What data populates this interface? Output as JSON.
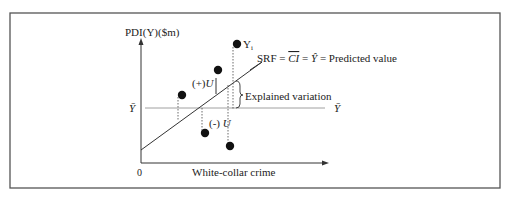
{
  "diagram": {
    "y_axis_label": "PDI(Y)($m)",
    "x_axis_label": "White-collar crime",
    "origin_label": "0",
    "ybar_left": "Ȳ",
    "ybar_right": "Ȳ",
    "point_label": "Y",
    "point_label_sub": "i",
    "srf_label": "SRF = CI = Ŷ = Predicted value",
    "srf_prefix": "SRF =",
    "srf_ci": "CI",
    "srf_eq": "=",
    "srf_yhat": "Ŷ",
    "srf_suffix": "= Predicted value",
    "positive_residual_label": "(+)U",
    "positive_residual_sign": "(+)",
    "negative_residual_sign": "(-)",
    "residual_symbol": "U",
    "explained_label": "Explained variation",
    "colors": {
      "line": "#333333",
      "points": "#111111",
      "frame": "#555555"
    },
    "points": [
      {
        "x": 182,
        "y": 95
      },
      {
        "x": 218,
        "y": 70
      },
      {
        "x": 205,
        "y": 133
      },
      {
        "x": 237,
        "y": 44
      },
      {
        "x": 230,
        "y": 146
      }
    ]
  }
}
